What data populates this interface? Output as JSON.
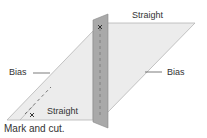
{
  "labels": {
    "straight_top": "Straight",
    "straight_bottom": "Straight",
    "bias_left": "Bias",
    "bias_right": "Bias",
    "caption": "Mark and cut."
  },
  "colors": {
    "fabric": "#ececec",
    "fabric_edge": "#b5b5b5",
    "strip": "#a9a9a9",
    "strip_edge": "#888888"
  }
}
